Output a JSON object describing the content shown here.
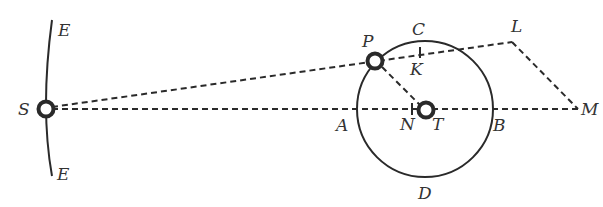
{
  "diagram": {
    "type": "geometric-astronomy-figure",
    "colors": {
      "ink": "#2a2a2a",
      "label": "#333333",
      "background": "#ffffff"
    },
    "points": {
      "S": {
        "label": "S",
        "x": 46,
        "y": 109,
        "kind": "body"
      },
      "P": {
        "label": "P",
        "x": 375,
        "y": 60,
        "kind": "body"
      },
      "T": {
        "label": "T",
        "x": 425,
        "y": 109,
        "kind": "body"
      },
      "L": {
        "label": "L",
        "x": 512,
        "y": 42,
        "kind": "vertex"
      },
      "M": {
        "label": "M",
        "x": 578,
        "y": 109,
        "kind": "vertex"
      },
      "K": {
        "label": "K",
        "x": 420,
        "y": 53,
        "kind": "tick"
      },
      "N": {
        "label": "N",
        "x": 412,
        "y": 109,
        "kind": "tick"
      },
      "A": {
        "label": "A",
        "x": 357,
        "y": 109,
        "kind": "circle-point"
      },
      "B": {
        "label": "B",
        "x": 493,
        "y": 109,
        "kind": "circle-point"
      },
      "C": {
        "label": "C",
        "x": 425,
        "y": 41,
        "kind": "circle-point"
      },
      "D": {
        "label": "D",
        "x": 425,
        "y": 177,
        "kind": "circle-point"
      }
    },
    "labels": {
      "E_top": "E",
      "E_bottom": "E",
      "S": "S",
      "P": "P",
      "C": "C",
      "K": "K",
      "L": "L",
      "A": "A",
      "N": "N",
      "T": "T",
      "B": "B",
      "M": "M",
      "D": "D"
    },
    "circle": {
      "center": "T",
      "radius": 68
    },
    "arc_EE": {
      "description": "orbit arc through S from top E to bottom E"
    },
    "lines": [
      {
        "from": "S",
        "to": "L",
        "style": "dashed"
      },
      {
        "from": "S",
        "to": "M",
        "style": "dashed"
      },
      {
        "from": "L",
        "to": "M",
        "style": "dashed"
      },
      {
        "from": "P",
        "to": "T",
        "style": "dashed"
      }
    ]
  }
}
